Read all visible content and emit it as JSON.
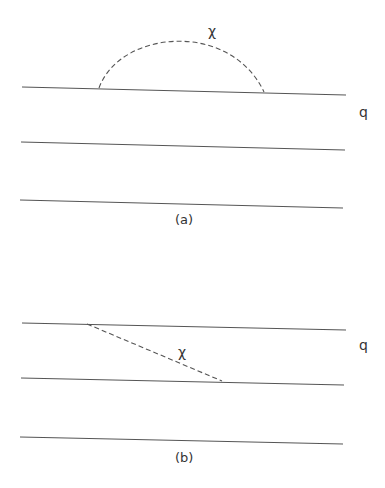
{
  "diagrams": [
    {
      "caption": "(a)",
      "line_label": "q",
      "propagator_label": "χ",
      "description": "three parallel quark lines with a chi exchange arc on the top line"
    },
    {
      "caption": "(b)",
      "line_label": "q",
      "propagator_label": "χ",
      "description": "three parallel quark lines with a chi exchange between the top and middle lines"
    }
  ],
  "colors": {
    "line": "#555555",
    "text": "#333333",
    "background": "#ffffff"
  }
}
